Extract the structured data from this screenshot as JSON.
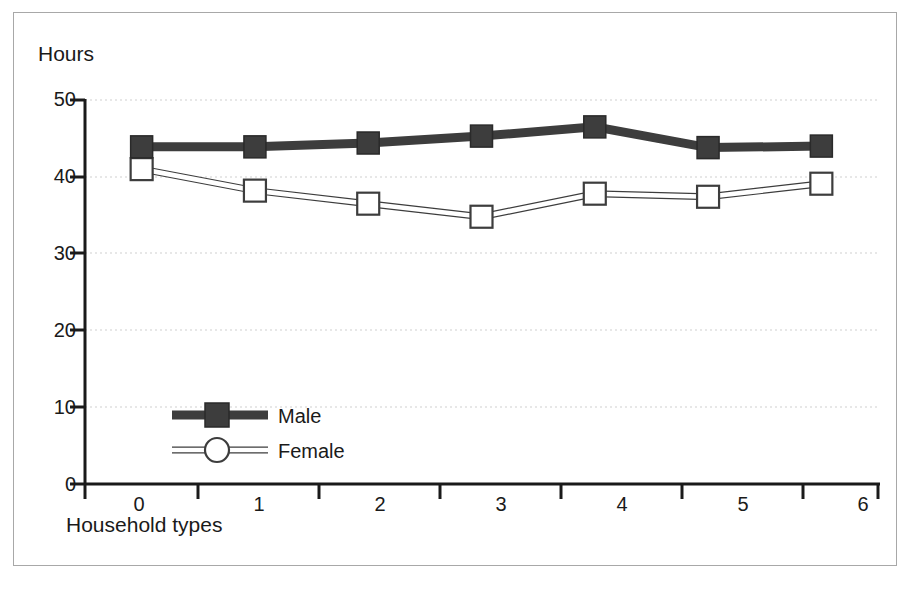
{
  "chart_data": {
    "type": "line",
    "title": "",
    "subtitle": "",
    "ylabel": "Hours",
    "xlabel": "Household types",
    "categories": [
      "0",
      "1",
      "2",
      "3",
      "4",
      "5",
      "6"
    ],
    "x": [
      0,
      1,
      2,
      3,
      4,
      5,
      6
    ],
    "ylim": [
      0,
      50
    ],
    "xlim": [
      -0.5,
      6.5
    ],
    "ytick_labels": [
      "0",
      "10",
      "20",
      "30",
      "40",
      "50"
    ],
    "ytick_values": [
      0,
      10,
      20,
      30,
      40,
      50
    ],
    "grid": "horizontal-dotted",
    "legend_position": "inside-lower-left",
    "series": [
      {
        "name": "Male",
        "values": [
          43.9,
          43.9,
          44.4,
          45.3,
          46.5,
          43.8,
          44.0
        ],
        "color": "#3d3d3d",
        "marker": "filled-square",
        "line_style": "thick-solid"
      },
      {
        "name": "Female",
        "values": [
          41.0,
          38.2,
          36.5,
          34.8,
          37.8,
          37.4,
          39.1
        ],
        "color": "#3d3d3d",
        "marker": "open-square",
        "line_style": "thin-double"
      }
    ]
  },
  "legend": {
    "entries": [
      {
        "label": "Male",
        "marker": "filled-square"
      },
      {
        "label": "Female",
        "marker": "open-circle"
      }
    ]
  },
  "colors": {
    "series_dark": "#3d3d3d",
    "axis": "#1a1a1a",
    "grid": "#cfcfcf",
    "frame": "#a8a8a8",
    "background": "#ffffff"
  }
}
